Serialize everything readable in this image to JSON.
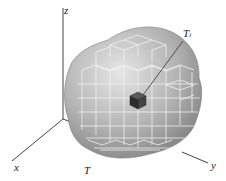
{
  "figure": {
    "axes": {
      "x_label": "x",
      "y_label": "y",
      "z_label": "z"
    },
    "region_label": "T",
    "box_label_main": "T",
    "box_label_sub": "i",
    "colors": {
      "blob_fill": "#8f8f8f",
      "blob_highlight": "#d8d8d8",
      "grid_lines": "#f2f2f2",
      "highlight_box": "#3a3a3a",
      "axis": "#333333"
    }
  }
}
